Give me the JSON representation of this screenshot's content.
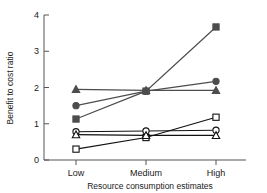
{
  "chart_data": {
    "type": "line",
    "title": "",
    "xlabel": "Resource consumption estimates",
    "ylabel": "Benefit to cost ratio",
    "categories": [
      "Low",
      "Medium",
      "High"
    ],
    "ylim": [
      0,
      4
    ],
    "yticks": [
      0,
      1,
      2,
      3,
      4
    ],
    "ytick_labels": [
      "0",
      "1",
      "2",
      "3",
      "4"
    ],
    "grid": false,
    "legend": "none",
    "series": [
      {
        "name": "filled-square",
        "marker": "filled-square",
        "color": "#4d4d4d",
        "values": [
          1.13,
          1.9,
          3.67
        ]
      },
      {
        "name": "filled-circle",
        "marker": "filled-circle",
        "color": "#4d4d4d",
        "values": [
          1.5,
          1.9,
          2.17
        ]
      },
      {
        "name": "filled-triangle",
        "marker": "filled-triangle",
        "color": "#4d4d4d",
        "values": [
          1.95,
          1.92,
          1.92
        ]
      },
      {
        "name": "open-square",
        "marker": "open-square",
        "color": "#111111",
        "values": [
          0.3,
          0.62,
          1.18
        ]
      },
      {
        "name": "open-circle",
        "marker": "open-circle",
        "color": "#111111",
        "values": [
          0.78,
          0.8,
          0.82
        ]
      },
      {
        "name": "open-triangle",
        "marker": "open-triangle",
        "color": "#111111",
        "values": [
          0.7,
          0.68,
          0.68
        ]
      }
    ]
  }
}
